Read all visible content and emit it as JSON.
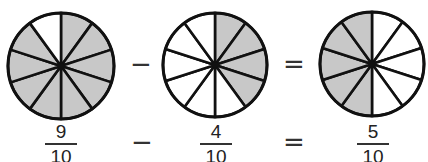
{
  "colors": {
    "shaded": "#c8c8c8",
    "unshaded": "#ffffff",
    "stroke": "#111111"
  },
  "equation": {
    "operator_minus": "−",
    "operator_equals": "=",
    "fractions": [
      {
        "numerator": "9",
        "denominator": "10"
      },
      {
        "numerator": "4",
        "denominator": "10"
      },
      {
        "numerator": "5",
        "denominator": "10"
      }
    ]
  },
  "circles": [
    {
      "cx": 61,
      "cy": 66,
      "r": 53,
      "sectors": 10,
      "shaded_sectors": [
        0,
        1,
        2,
        3,
        4,
        5,
        6,
        7,
        8
      ]
    },
    {
      "cx": 215,
      "cy": 65,
      "r": 52,
      "sectors": 10,
      "shaded_sectors": [
        0,
        1,
        2,
        3
      ]
    },
    {
      "cx": 372,
      "cy": 64,
      "r": 52,
      "sectors": 10,
      "shaded_sectors": [
        5,
        6,
        7,
        8,
        9
      ]
    }
  ]
}
